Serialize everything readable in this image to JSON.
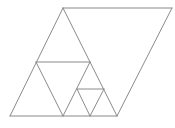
{
  "diagram": {
    "stroke_color": "#8a8a8a",
    "background": "#ffffff",
    "segments": [
      {
        "name": "parallelogram-top-edge",
        "x1": 63,
        "y1": 8,
        "x2": 172,
        "y2": 8
      },
      {
        "name": "parallelogram-right-edge",
        "x1": 172,
        "y1": 8,
        "x2": 117,
        "y2": 116
      },
      {
        "name": "big-triangle-left-edge",
        "x1": 63,
        "y1": 8,
        "x2": 10,
        "y2": 116
      },
      {
        "name": "big-triangle-right-edge",
        "x1": 63,
        "y1": 8,
        "x2": 117,
        "y2": 116
      },
      {
        "name": "base-line",
        "x1": 10,
        "y1": 116,
        "x2": 117,
        "y2": 116
      },
      {
        "name": "mid-horizontal-line",
        "x1": 36,
        "y1": 62,
        "x2": 90,
        "y2": 62
      },
      {
        "name": "inner-triangle-left-edge",
        "x1": 36,
        "y1": 62,
        "x2": 63,
        "y2": 116
      },
      {
        "name": "inner-triangle-right-edge",
        "x1": 90,
        "y1": 62,
        "x2": 63,
        "y2": 116
      },
      {
        "name": "small-horizontal-line",
        "x1": 77,
        "y1": 89,
        "x2": 104,
        "y2": 89
      },
      {
        "name": "small-triangle-left-edge",
        "x1": 77,
        "y1": 89,
        "x2": 90,
        "y2": 116
      },
      {
        "name": "small-triangle-right-edge",
        "x1": 104,
        "y1": 89,
        "x2": 90,
        "y2": 116
      }
    ]
  }
}
